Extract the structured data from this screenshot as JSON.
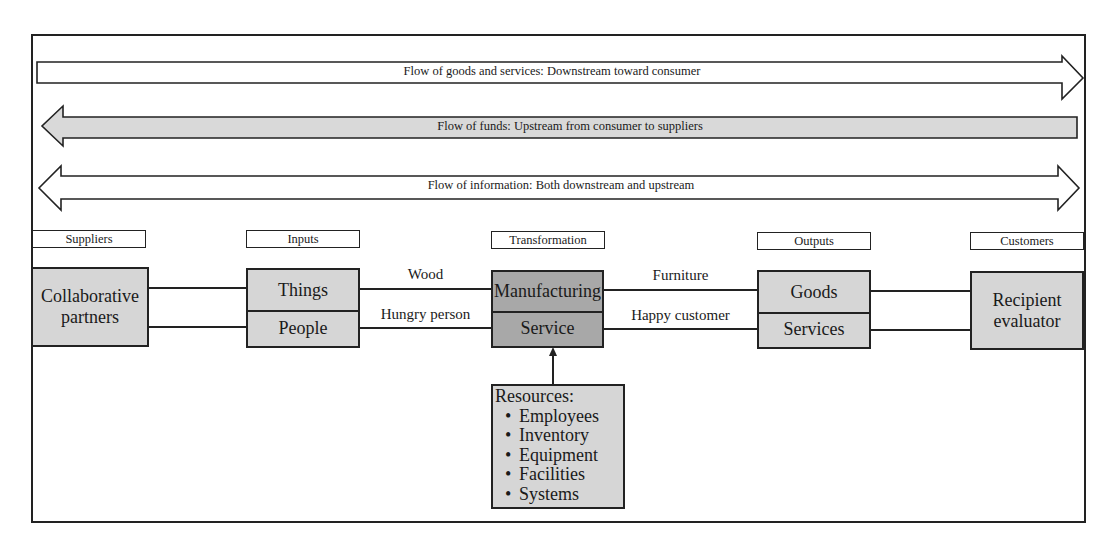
{
  "flows": [
    {
      "label": "Flow of goods and services: Downstream toward consumer",
      "direction": "right",
      "fill": "#ffffff"
    },
    {
      "label": "Flow of funds: Upstream from consumer to suppliers",
      "direction": "left",
      "fill": "#d9d9d9"
    },
    {
      "label": "Flow of information: Both downstream and upstream",
      "direction": "both",
      "fill": "#ffffff"
    }
  ],
  "categories": {
    "suppliers": "Suppliers",
    "inputs": "Inputs",
    "transformation": "Transformation",
    "outputs": "Outputs",
    "customers": "Customers"
  },
  "nodes": {
    "suppliers": {
      "line1": "Collaborative",
      "line2": "partners"
    },
    "inputs": {
      "top": "Things",
      "bottom": "People"
    },
    "transformation": {
      "top": "Manufacturing",
      "bottom": "Service"
    },
    "outputs": {
      "top": "Goods",
      "bottom": "Services"
    },
    "customers": {
      "line1": "Recipient",
      "line2": "evaluator"
    }
  },
  "connectors": {
    "inputs_to_transformation_top": "Wood",
    "inputs_to_transformation_bottom": "Hungry person",
    "transformation_to_outputs_top": "Furniture",
    "transformation_to_outputs_bottom": "Happy customer"
  },
  "resources": {
    "title": "Resources:",
    "items": [
      "Employees",
      "Inventory",
      "Equipment",
      "Facilities",
      "Systems"
    ]
  },
  "colors": {
    "light_fill": "#d6d6d6",
    "dark_fill": "#a8a8a8",
    "stroke": "#222222"
  }
}
